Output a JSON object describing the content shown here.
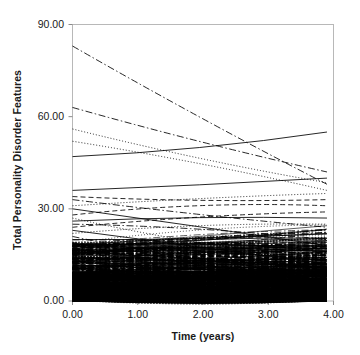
{
  "chart_data": {
    "type": "line",
    "title": "",
    "xlabel": "Time (years)",
    "ylabel": "Total Personality Disorder Features",
    "xlim": [
      0.0,
      4.0
    ],
    "ylim": [
      0.0,
      90.0
    ],
    "xticks": [
      "0.00",
      "1.00",
      "2.00",
      "3.00",
      "4.00"
    ],
    "xtick_values": [
      0.0,
      1.0,
      2.0,
      3.0,
      4.0
    ],
    "yticks": [
      "0.00",
      "30.00",
      "60.00",
      "90.00"
    ],
    "ytick_values": [
      0.0,
      30.0,
      60.0,
      90.0
    ],
    "grid": false,
    "legend": null,
    "series": [
      {
        "name": "case-1",
        "style": "dashdot",
        "x": [
          0.0,
          3.9
        ],
        "values": [
          83.0,
          38.0
        ]
      },
      {
        "name": "case-2",
        "style": "dashdot",
        "x": [
          0.0,
          3.9
        ],
        "values": [
          63.0,
          42.0
        ]
      },
      {
        "name": "case-3",
        "style": "dotted",
        "x": [
          0.0,
          3.9
        ],
        "values": [
          56.0,
          38.5
        ]
      },
      {
        "name": "case-4",
        "style": "dotted",
        "x": [
          0.0,
          3.9
        ],
        "values": [
          52.0,
          36.0
        ]
      },
      {
        "name": "case-5",
        "style": "solid",
        "x": [
          0.0,
          3.9
        ],
        "values": [
          47.0,
          55.0
        ]
      },
      {
        "name": "case-6",
        "style": "solid",
        "x": [
          0.0,
          3.9
        ],
        "values": [
          36.0,
          40.0
        ]
      },
      {
        "name": "case-7",
        "style": "dashed",
        "x": [
          0.0,
          3.9
        ],
        "values": [
          34.0,
          33.0
        ]
      },
      {
        "name": "case-8",
        "style": "dashdot",
        "x": [
          0.0,
          3.9
        ],
        "values": [
          33.0,
          24.0
        ]
      },
      {
        "name": "case-9",
        "style": "dotted",
        "x": [
          0.0,
          3.9
        ],
        "values": [
          31.0,
          35.0
        ]
      },
      {
        "name": "case-10",
        "style": "solid",
        "x": [
          0.0,
          3.9
        ],
        "values": [
          30.0,
          18.0
        ]
      },
      {
        "name": "case-11",
        "style": "dashed",
        "x": [
          0.0,
          3.9
        ],
        "values": [
          28.0,
          31.0
        ]
      },
      {
        "name": "case-12",
        "style": "dotted",
        "x": [
          0.0,
          3.9
        ],
        "values": [
          27.0,
          14.0
        ]
      },
      {
        "name": "case-13",
        "style": "solid",
        "x": [
          0.0,
          3.9
        ],
        "values": [
          26.0,
          27.0
        ]
      },
      {
        "name": "case-14",
        "style": "dashdot",
        "x": [
          0.0,
          3.9
        ],
        "values": [
          25.0,
          20.0
        ]
      },
      {
        "name": "case-15",
        "style": "dashed",
        "x": [
          0.0,
          3.9
        ],
        "values": [
          24.0,
          29.0
        ]
      },
      {
        "name": "case-16",
        "style": "solid",
        "x": [
          0.0,
          3.9
        ],
        "values": [
          23.0,
          12.0
        ]
      },
      {
        "name": "case-17",
        "style": "dotted",
        "x": [
          0.0,
          3.9
        ],
        "values": [
          22.0,
          25.0
        ]
      },
      {
        "name": "case-18",
        "style": "dashdot",
        "x": [
          0.0,
          3.9
        ],
        "values": [
          21.0,
          9.0
        ]
      },
      {
        "name": "case-19",
        "style": "solid",
        "x": [
          0.0,
          3.9
        ],
        "values": [
          20.0,
          22.0
        ]
      },
      {
        "name": "case-20",
        "style": "dashed",
        "x": [
          0.0,
          3.9
        ],
        "values": [
          19.0,
          8.0
        ]
      },
      {
        "name": "case-21",
        "style": "dotted",
        "x": [
          0.0,
          3.9
        ],
        "values": [
          18.0,
          19.0
        ]
      },
      {
        "name": "case-22",
        "style": "solid",
        "x": [
          0.0,
          3.9
        ],
        "values": [
          17.0,
          6.0
        ]
      },
      {
        "name": "case-23",
        "style": "dashdot",
        "x": [
          0.0,
          3.9
        ],
        "values": [
          16.0,
          17.0
        ]
      },
      {
        "name": "case-24",
        "style": "dashed",
        "x": [
          0.0,
          3.9
        ],
        "values": [
          15.0,
          5.0
        ]
      },
      {
        "name": "case-25",
        "style": "dotted",
        "x": [
          0.0,
          3.9
        ],
        "values": [
          14.0,
          15.0
        ]
      },
      {
        "name": "case-26",
        "style": "solid",
        "x": [
          0.0,
          3.9
        ],
        "values": [
          13.0,
          4.0
        ]
      },
      {
        "name": "case-27",
        "style": "dashdot",
        "x": [
          0.0,
          3.9
        ],
        "values": [
          12.0,
          13.0
        ]
      },
      {
        "name": "case-28",
        "style": "dashed",
        "x": [
          0.0,
          3.9
        ],
        "values": [
          11.0,
          3.0
        ]
      },
      {
        "name": "case-29",
        "style": "dotted",
        "x": [
          0.0,
          3.9
        ],
        "values": [
          10.0,
          11.0
        ]
      },
      {
        "name": "case-30",
        "style": "solid",
        "x": [
          0.0,
          3.9
        ],
        "values": [
          9.0,
          2.0
        ]
      },
      {
        "name": "case-31",
        "style": "dashdot",
        "x": [
          0.0,
          3.9
        ],
        "values": [
          8.0,
          9.0
        ]
      },
      {
        "name": "case-32",
        "style": "dashed",
        "x": [
          0.0,
          3.9
        ],
        "values": [
          7.0,
          1.5
        ]
      },
      {
        "name": "case-33",
        "style": "dotted",
        "x": [
          0.0,
          3.9
        ],
        "values": [
          6.0,
          7.0
        ]
      },
      {
        "name": "case-34",
        "style": "solid",
        "x": [
          0.0,
          3.9
        ],
        "values": [
          5.0,
          1.0
        ]
      },
      {
        "name": "case-35",
        "style": "dashdot",
        "x": [
          0.0,
          3.9
        ],
        "values": [
          4.0,
          5.0
        ]
      },
      {
        "name": "case-36",
        "style": "dashed",
        "x": [
          0.0,
          3.9
        ],
        "values": [
          3.0,
          0.5
        ]
      },
      {
        "name": "case-37",
        "style": "dotted",
        "x": [
          0.0,
          3.9
        ],
        "values": [
          2.0,
          3.0
        ]
      },
      {
        "name": "case-38",
        "style": "solid",
        "x": [
          0.0,
          3.9
        ],
        "values": [
          1.0,
          0.5
        ]
      },
      {
        "name": "case-39",
        "style": "dashdot",
        "x": [
          0.0,
          3.9
        ],
        "values": [
          0.5,
          2.0
        ]
      },
      {
        "name": "case-40",
        "style": "dashed",
        "x": [
          0.0,
          3.9
        ],
        "values": [
          0.0,
          1.0
        ]
      }
    ],
    "dense_band": {
      "note": "Several hundred additional overlapping trajectories occupy the region below roughly 18, saturating to solid black near 0-10.",
      "count_approx": 420,
      "y_range": [
        0.0,
        18.0
      ]
    },
    "colors": {
      "line": "#000000",
      "axis": "#b4b4b4",
      "text": "#1a1a1a",
      "background": "#ffffff"
    }
  }
}
